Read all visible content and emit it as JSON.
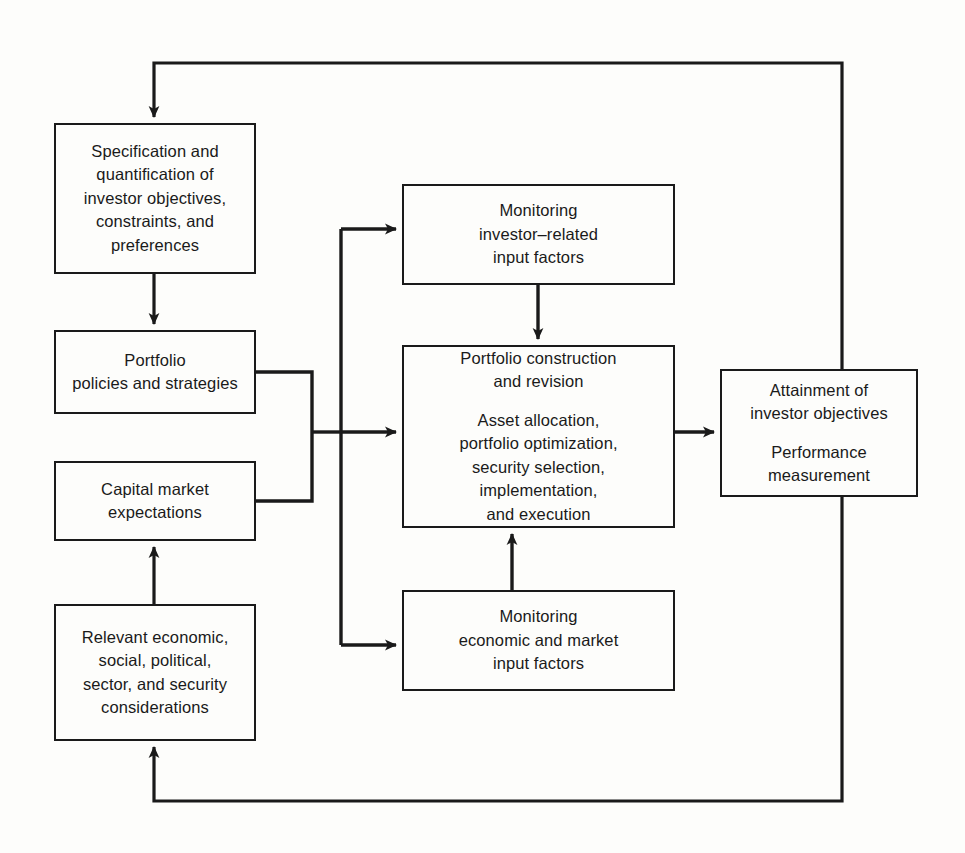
{
  "diagram": {
    "type": "flowchart",
    "background_color": "#fdfdfb",
    "line_color": "#1a1a1a",
    "nodes": [
      {
        "id": "specification",
        "name": "specification-box",
        "lines": [
          "Specification and",
          "quantification of",
          "investor objectives,",
          "constraints, and",
          "preferences"
        ],
        "x": 54,
        "y": 123,
        "w": 202,
        "h": 151
      },
      {
        "id": "policies",
        "name": "portfolio-policies-box",
        "lines": [
          "Portfolio",
          "policies and strategies"
        ],
        "x": 54,
        "y": 330,
        "w": 202,
        "h": 84
      },
      {
        "id": "capital",
        "name": "capital-market-box",
        "lines": [
          "Capital market",
          "expectations"
        ],
        "x": 54,
        "y": 461,
        "w": 202,
        "h": 80
      },
      {
        "id": "relevant",
        "name": "relevant-considerations-box",
        "lines": [
          "Relevant economic,",
          "social, political,",
          "sector, and security",
          "considerations"
        ],
        "x": 54,
        "y": 604,
        "w": 202,
        "h": 137
      },
      {
        "id": "monitor-investor",
        "name": "monitoring-investor-box",
        "lines": [
          "Monitoring",
          "investor–related",
          "input factors"
        ],
        "x": 402,
        "y": 184,
        "w": 273,
        "h": 101
      },
      {
        "id": "construction",
        "name": "portfolio-construction-box",
        "lines_top": [
          "Portfolio construction",
          "and revision"
        ],
        "lines_bottom": [
          "Asset allocation,",
          "portfolio optimization,",
          "security selection,",
          "implementation,",
          "and execution"
        ],
        "x": 402,
        "y": 345,
        "w": 273,
        "h": 183
      },
      {
        "id": "monitor-economic",
        "name": "monitoring-economic-box",
        "lines": [
          "Monitoring",
          "economic and market",
          "input factors"
        ],
        "x": 402,
        "y": 590,
        "w": 273,
        "h": 101
      },
      {
        "id": "attainment",
        "name": "attainment-box",
        "lines_top": [
          "Attainment of",
          "investor objectives"
        ],
        "lines_bottom": [
          "Performance",
          "measurement"
        ],
        "x": 720,
        "y": 369,
        "w": 198,
        "h": 128
      }
    ],
    "connectors": [
      {
        "name": "top-feedback-loop",
        "from": "attainment",
        "to": "specification",
        "arrow": "down"
      },
      {
        "name": "specification-to-policies",
        "from": "specification",
        "to": "policies",
        "arrow": "down"
      },
      {
        "name": "policies-capital-bracket",
        "from": "policies-and-capital",
        "to": "trunk",
        "arrow": "none"
      },
      {
        "name": "trunk-to-monitor-investor",
        "from": "trunk",
        "to": "monitor-investor",
        "arrow": "right"
      },
      {
        "name": "trunk-to-construction",
        "from": "trunk",
        "to": "construction",
        "arrow": "right"
      },
      {
        "name": "trunk-to-monitor-economic",
        "from": "trunk",
        "to": "monitor-economic",
        "arrow": "right"
      },
      {
        "name": "monitor-investor-to-construction",
        "from": "monitor-investor",
        "to": "construction",
        "arrow": "down"
      },
      {
        "name": "monitor-economic-to-construction",
        "from": "monitor-economic",
        "to": "construction",
        "arrow": "up"
      },
      {
        "name": "construction-to-attainment",
        "from": "construction",
        "to": "attainment",
        "arrow": "right"
      },
      {
        "name": "relevant-to-capital",
        "from": "relevant",
        "to": "capital",
        "arrow": "up"
      },
      {
        "name": "bottom-feedback-loop",
        "from": "attainment",
        "to": "relevant",
        "arrow": "up"
      }
    ]
  }
}
